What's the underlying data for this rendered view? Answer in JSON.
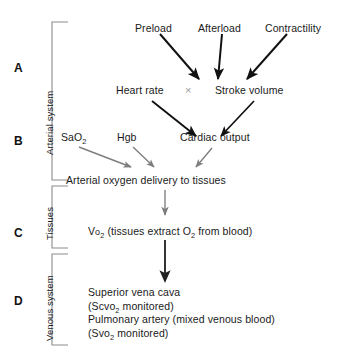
{
  "diagram": {
    "colors": {
      "text": "#1a1a1a",
      "arrow_dark": "#111111",
      "arrow_gray": "#7d7d7d",
      "bracket": "#8c8c8c",
      "times_symbol": "#9a9a9a",
      "background": "#ffffff"
    }
  },
  "sections": [
    {
      "letter": "A",
      "side_label": "Arterial system"
    },
    {
      "letter": "B",
      "side_label": "Arterial system"
    },
    {
      "letter": "C",
      "side_label": "Tissues"
    },
    {
      "letter": "D",
      "side_label": "Venous system"
    }
  ],
  "side_labels": {
    "arterial": "Arterial system",
    "tissues": "Tissues",
    "venous": "Venous system"
  },
  "letters": {
    "a": "A",
    "b": "B",
    "c": "C",
    "d": "D"
  },
  "nodes": {
    "preload": "Preload",
    "afterload": "Afterload",
    "contractility": "Contractility",
    "heart_rate": "Heart rate",
    "times": "×",
    "stroke_volume": "Stroke volume",
    "sao2_pre": "SaO",
    "sao2_sub": "2",
    "hgb": "Hgb",
    "cardiac_output": "Cardiac output",
    "arterial_delivery": "Arterial oxygen delivery to tissues",
    "vo2_pre": "V",
    "vo2_sub_o": "o",
    "vo2_sub_2": "2",
    "vo2_rest_a": " (tissues extract O",
    "vo2_rest_sub": "2",
    "vo2_rest_b": " from blood)",
    "svc_line1": "Superior vena cava",
    "svc_line2_pre": "(Scvo",
    "svc_line2_sub": "2",
    "svc_line2_post": " monitored)",
    "pa_line1": "Pulmonary artery (mixed venous blood)",
    "pa_line2_pre": "(Svo",
    "pa_line2_sub": "2",
    "pa_line2_post": " monitored)"
  }
}
